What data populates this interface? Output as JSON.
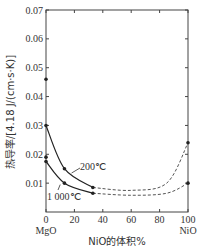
{
  "chart_data": {
    "type": "line",
    "title": "",
    "xlabel": "NiO的体积%",
    "ylabel": "热导率/[4.18 J/(cm·s·K)]",
    "xlim": [
      0,
      100
    ],
    "ylim": [
      0,
      0.07
    ],
    "x_ticks": [
      "0",
      "20",
      "40",
      "60",
      "80",
      "100"
    ],
    "y_ticks": [
      "0.01",
      "0.02",
      "0.03",
      "0.04",
      "0.05",
      "0.06",
      "0.07"
    ],
    "x_end_labels": {
      "left": "MgO",
      "right": "NiO"
    },
    "grid": false,
    "series": [
      {
        "name": "200℃",
        "measured": [
          [
            0,
            0.03
          ],
          [
            13,
            0.015
          ],
          [
            33,
            0.0085
          ]
        ],
        "extrapolated": [
          [
            33,
            0.0085
          ],
          [
            60,
            0.0075
          ],
          [
            85,
            0.01
          ],
          [
            100,
            0.024
          ]
        ]
      },
      {
        "name": "1 000℃",
        "measured": [
          [
            0,
            0.0175
          ],
          [
            13,
            0.01
          ],
          [
            33,
            0.0065
          ]
        ],
        "extrapolated": [
          [
            33,
            0.0065
          ],
          [
            60,
            0.0058
          ],
          [
            85,
            0.0065
          ],
          [
            100,
            0.01
          ]
        ]
      }
    ],
    "extra_points": [
      [
        0,
        0.046
      ],
      [
        0,
        0.019
      ],
      [
        100,
        0.024
      ],
      [
        100,
        0.01
      ]
    ]
  }
}
